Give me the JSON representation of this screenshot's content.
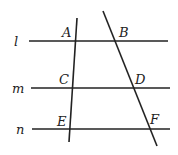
{
  "diagram": {
    "parallel_lines": [
      {
        "name": "l",
        "label": "l",
        "y": 41,
        "x1": 29,
        "x2": 168,
        "lx": 14,
        "ly": 46
      },
      {
        "name": "m",
        "label": "m",
        "y": 88,
        "x1": 31,
        "x2": 170,
        "lx": 12,
        "ly": 93
      },
      {
        "name": "n",
        "label": "n",
        "y": 129,
        "x1": 32,
        "x2": 170,
        "lx": 16,
        "ly": 134
      }
    ],
    "transversals": [
      {
        "name": "ACE",
        "x1": 77,
        "y1": 18,
        "x2": 69,
        "y2": 142
      },
      {
        "name": "BDF",
        "x1": 103,
        "y1": 11,
        "x2": 157,
        "y2": 146
      }
    ],
    "points": [
      {
        "label": "A",
        "x": 62,
        "y": 37
      },
      {
        "label": "B",
        "x": 119,
        "y": 37
      },
      {
        "label": "C",
        "x": 59,
        "y": 84
      },
      {
        "label": "D",
        "x": 135,
        "y": 84
      },
      {
        "label": "E",
        "x": 57,
        "y": 126
      },
      {
        "label": "F",
        "x": 150,
        "y": 124
      }
    ]
  }
}
